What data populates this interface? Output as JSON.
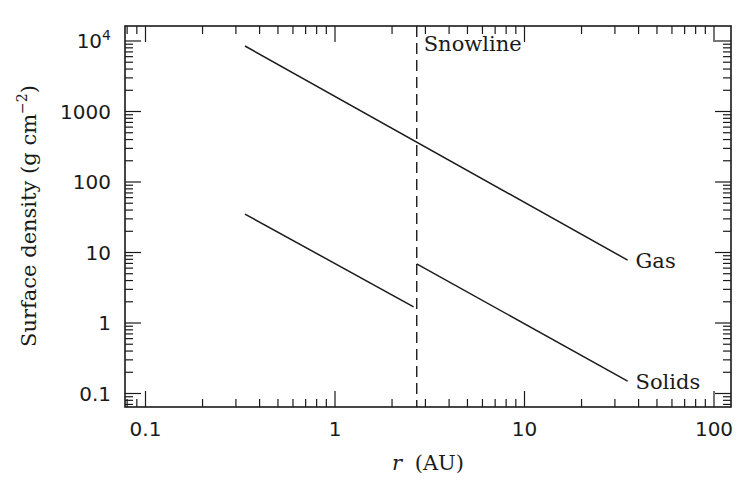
{
  "chart_data": {
    "type": "line",
    "title": "",
    "xlabel": "r (AU)",
    "xlabel_var": "r",
    "xlabel_unit": "(AU)",
    "ylabel": "Surface density (g cm^-2)",
    "ylabel_text": "Surface density (g cm",
    "ylabel_exp": "−2",
    "ylabel_close": ")",
    "xscale": "log",
    "yscale": "log",
    "xlim": [
      0.08,
      120
    ],
    "ylim": [
      0.08,
      15000
    ],
    "grid": false,
    "legend": "inline labels",
    "x_ticks": [
      {
        "value": 0.1,
        "label": "0.1"
      },
      {
        "value": 1,
        "label": "1"
      },
      {
        "value": 10,
        "label": "10"
      },
      {
        "value": 100,
        "label": "100"
      }
    ],
    "y_ticks": [
      {
        "value": 0.1,
        "label": "0.1"
      },
      {
        "value": 1,
        "label": "1"
      },
      {
        "value": 10,
        "label": "10"
      },
      {
        "value": 100,
        "label": "100"
      },
      {
        "value": 1000,
        "label": "1000"
      },
      {
        "value": 10000,
        "label": "10",
        "exp": "4"
      }
    ],
    "series": [
      {
        "name": "Gas",
        "label": "Gas",
        "style": "solid",
        "x": [
          0.335,
          35
        ],
        "y": [
          8500,
          7.8
        ]
      },
      {
        "name": "Solids (inside snowline)",
        "label": "",
        "style": "solid",
        "x": [
          0.335,
          2.6
        ],
        "y": [
          35,
          1.7
        ]
      },
      {
        "name": "Solids (outside snowline)",
        "label": "Solids",
        "style": "solid",
        "x": [
          2.7,
          35
        ],
        "y": [
          6.9,
          0.15
        ]
      }
    ],
    "annotations": [
      {
        "type": "vline",
        "x": 2.7,
        "style": "dashed",
        "label": "Snowline"
      }
    ]
  },
  "colors": {
    "line": "#1a1a1a",
    "background": "#ffffff"
  }
}
